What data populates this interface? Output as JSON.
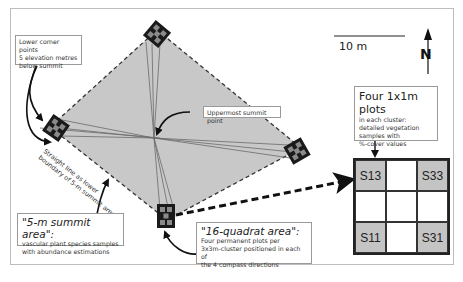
{
  "callouts": {
    "lower_corner": {
      "lines": [
        "Lower corner points",
        "5 elevation metres",
        "below summit"
      ]
    },
    "summit_point": {
      "label": "Uppermost summit point"
    },
    "straight_line": {
      "lines": [
        "Straight line as lower",
        "boundary of 5-m summit area"
      ]
    },
    "summit_area": {
      "title": "\"5-m summit area\":",
      "lines": [
        "vascular plant species samples",
        "with abundance estimations"
      ]
    },
    "quadrat_area": {
      "title": "\"16-quadrat area\":",
      "lines": [
        "Four permanent plots per",
        "3x3m-cluster positioned in each of",
        "the 4 compass directions"
      ]
    },
    "plots": {
      "title": "Four 1x1m plots",
      "lines": [
        "in each cluster:",
        "detailed vegetation",
        "samples with",
        "%-cover values"
      ]
    }
  },
  "scale_bar": {
    "label": "10 m"
  },
  "north_arrow": {
    "label": "N"
  },
  "cluster_grid": {
    "cells": [
      "S13",
      "",
      "S33",
      "",
      "",
      "",
      "S11",
      "",
      "S31"
    ],
    "shaded": [
      true,
      false,
      true,
      false,
      false,
      false,
      true,
      false,
      true
    ]
  },
  "colors": {
    "summit_fill": "#c8c8c8",
    "cluster_dark": "#1a1a1a",
    "cluster_light": "#8a8a8a",
    "shaded_plot": "#c4c4c4"
  }
}
